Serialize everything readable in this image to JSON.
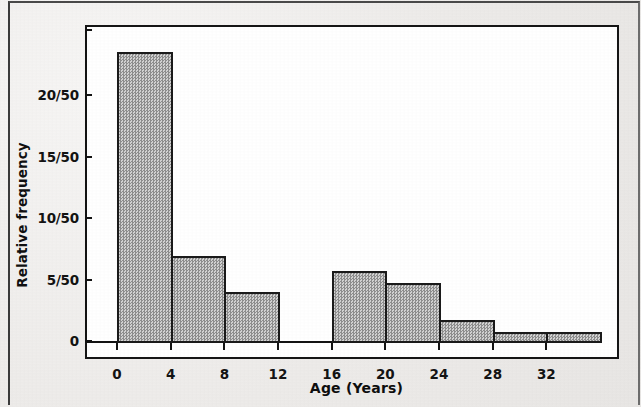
{
  "figure": {
    "kind": "histogram-figure",
    "paper_color": "#edebe9",
    "ink_color": "#151515",
    "bar_fill_color": "#b4b4b4"
  },
  "chart_data": {
    "type": "bar",
    "title": "",
    "subtitle": "",
    "xlabel": "Age (Years)",
    "ylabel": "Relative frequency",
    "grid": false,
    "legend": null,
    "histogram": true,
    "bin_width": 4,
    "sample_size": 50,
    "xlim": [
      0,
      36
    ],
    "ylim": [
      0,
      24.5
    ],
    "y_tick_values": [
      0,
      5,
      10,
      15,
      20
    ],
    "y_tick_labels": [
      "0",
      "5/50",
      "10/50",
      "15/50",
      "20/50"
    ],
    "x_tick_values": [
      0,
      4,
      8,
      12,
      16,
      20,
      24,
      28,
      32
    ],
    "x_tick_labels": [
      "0",
      "4",
      "8",
      "12",
      "16",
      "20",
      "24",
      "28",
      "32"
    ],
    "bin_edges": [
      0,
      4,
      8,
      12,
      16,
      20,
      24,
      28,
      32,
      36
    ],
    "categories": [
      "0-4",
      "4-8",
      "8-12",
      "12-16",
      "16-20",
      "20-24",
      "24-28",
      "28-32",
      "32-36"
    ],
    "values": [
      23.5,
      6.9,
      4.0,
      0,
      5.7,
      4.7,
      1.7,
      0.7,
      0.7
    ],
    "value_labels": [
      "23.5/50",
      "6.9/50",
      "4/50",
      "0/50",
      "5.7/50",
      "4.7/50",
      "1.7/50",
      "0.7/50",
      "0.7/50"
    ],
    "bars": [
      {
        "label": "0-4",
        "x0": 0,
        "x1": 4,
        "value": 23.5
      },
      {
        "label": "4-8",
        "x0": 4,
        "x1": 8,
        "value": 6.9
      },
      {
        "label": "8-12",
        "x0": 8,
        "x1": 12,
        "value": 4.0
      },
      {
        "label": "12-16",
        "x0": 12,
        "x1": 16,
        "value": 0
      },
      {
        "label": "16-20",
        "x0": 16,
        "x1": 20,
        "value": 5.7
      },
      {
        "label": "20-24",
        "x0": 20,
        "x1": 24,
        "value": 4.7
      },
      {
        "label": "24-28",
        "x0": 24,
        "x1": 28,
        "value": 1.7
      },
      {
        "label": "28-32",
        "x0": 28,
        "x1": 32,
        "value": 0.7
      },
      {
        "label": "32-36",
        "x0": 32,
        "x1": 36,
        "value": 0.7
      }
    ]
  }
}
